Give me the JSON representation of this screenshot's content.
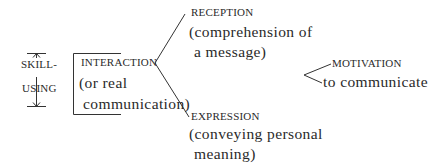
{
  "diagram": {
    "skill_using": {
      "line1": "SKILL-",
      "line2": "USING"
    },
    "interaction": {
      "title": "INTERACTION",
      "line2": "(or real",
      "line3": "communication)"
    },
    "reception": {
      "title": "RECEPTION",
      "line2": "(comprehension of",
      "line3": "a message)"
    },
    "expression": {
      "title": "EXPRESSION",
      "line2": "(conveying personal",
      "line3": "meaning)"
    },
    "motivation": {
      "title": "MOTIVATION",
      "line2": "to communicate"
    },
    "colors": {
      "ink": "#2a2a2a",
      "background": "#ffffff"
    }
  }
}
